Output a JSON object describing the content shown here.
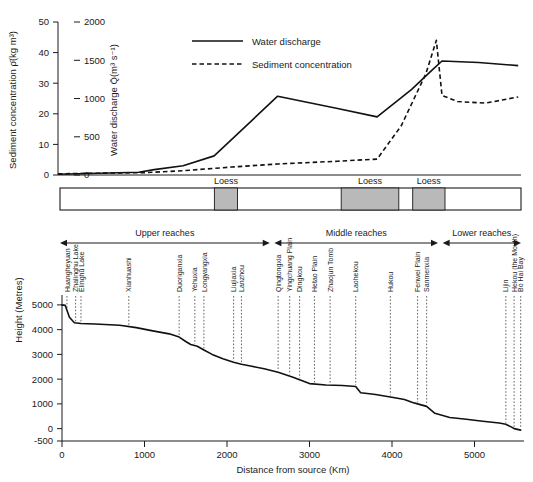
{
  "figure": {
    "title_hidden": "Yellow River longitudinal profile with water discharge and sediment concentration"
  },
  "top_chart": {
    "left_axis_title": "Sediment concentration  ρ̄(kg m³)",
    "right_axis_title": "Water discharge  Q̄(m³ s⁻¹)",
    "left_ticks": [
      "0",
      "10",
      "20",
      "30",
      "40",
      "50"
    ],
    "right_ticks": [
      "0",
      "500",
      "1000",
      "1500",
      "2000"
    ],
    "legend": [
      {
        "label": "Water discharge",
        "style": "solid"
      },
      {
        "label": "Sediment concentration",
        "style": "dashed"
      }
    ]
  },
  "loess_bar": {
    "label": "Loess",
    "bands": [
      {
        "start_pct": 33.5,
        "end_pct": 38.5
      },
      {
        "start_pct": 61.0,
        "end_pct": 73.5
      },
      {
        "start_pct": 76.5,
        "end_pct": 83.5
      }
    ]
  },
  "reaches": [
    {
      "label": "Upper reaches",
      "start_pct": 0.0,
      "end_pct": 45.5
    },
    {
      "label": "Middle reaches",
      "start_pct": 46.5,
      "end_pct": 82.0
    },
    {
      "label": "Lower reaches",
      "start_pct": 83.0,
      "end_pct": 100.0
    }
  ],
  "bottom_chart": {
    "y_axis_title": "Height (Metres)",
    "x_axis_title": "Distance from source (Km)",
    "y_ticks": [
      "-500",
      "0",
      "1000",
      "2000",
      "3000",
      "4000",
      "5000"
    ],
    "x_ticks": [
      "0",
      "1000",
      "2000",
      "3000",
      "4000",
      "5000"
    ],
    "xlim": [
      0,
      5600
    ],
    "ylim": [
      -500,
      5400
    ]
  },
  "sites": [
    {
      "name": "Huangheyuan",
      "km": 60
    },
    {
      "name": "Zhalinghu Lake",
      "km": 165
    },
    {
      "name": "Elinghu Lake",
      "km": 230
    },
    {
      "name": "Xianhuashi",
      "km": 810
    },
    {
      "name": "Duoriganxia",
      "km": 1420
    },
    {
      "name": "Yehuxia",
      "km": 1610
    },
    {
      "name": "Longyangxia",
      "km": 1720
    },
    {
      "name": "Liujiaxia",
      "km": 2080
    },
    {
      "name": "Lanzhou",
      "km": 2175
    },
    {
      "name": "Qingtongxia",
      "km": 2620
    },
    {
      "name": "Yingchuang Plain",
      "km": 2760
    },
    {
      "name": "Dingkou",
      "km": 2880
    },
    {
      "name": "Hetao Plain",
      "km": 3060
    },
    {
      "name": "Zhaojun Tomb",
      "km": 3250
    },
    {
      "name": "Laohekou",
      "km": 3560
    },
    {
      "name": "Hukou",
      "km": 3980
    },
    {
      "name": "Fenwei Plain",
      "km": 4310
    },
    {
      "name": "Sanmenxia",
      "km": 4420
    },
    {
      "name": "Lijin",
      "km": 5380
    },
    {
      "name": "Hekou (the Mouth)",
      "km": 5480
    },
    {
      "name": "Bo Hai Bay",
      "km": 5560
    }
  ],
  "chart_data": [
    {
      "type": "line",
      "id": "water-discharge",
      "title": "Water discharge along the Yellow River",
      "xlabel": "Distance from source (Km)",
      "ylabel": "Water discharge  Q̄(m³ s⁻¹)",
      "ylim": [
        0,
        2000
      ],
      "xlim": [
        0,
        5600
      ],
      "grid": false,
      "legend_position": "top-center",
      "x": [
        0,
        180,
        400,
        810,
        1250,
        2150,
        3000,
        3560,
        4050,
        4350,
        4480,
        5000,
        5560
      ],
      "values": [
        10,
        35,
        70,
        120,
        250,
        1030,
        870,
        760,
        1120,
        1380,
        1490,
        1470,
        1430
      ]
    },
    {
      "type": "line",
      "id": "sediment-concentration",
      "title": "Sediment concentration along the Yellow River",
      "xlabel": "Distance from source (Km)",
      "ylabel": "Sediment concentration  ρ̄(kg m³)",
      "ylim": [
        0,
        50
      ],
      "xlim": [
        0,
        5600
      ],
      "grid": false,
      "legend_position": "top-center",
      "x": [
        0,
        300,
        810,
        1500,
        2150,
        3000,
        3400,
        3560,
        3900,
        4250,
        4400,
        4480,
        4700,
        5100,
        5560
      ],
      "values": [
        0.4,
        0.8,
        1.4,
        2.6,
        3.6,
        4.5,
        5.0,
        5.2,
        16.0,
        33.0,
        44.0,
        26.0,
        24.0,
        23.5,
        25.5
      ]
    },
    {
      "type": "line",
      "id": "elevation-profile",
      "title": "Longitudinal elevation profile of the Yellow River",
      "xlabel": "Distance from source (Km)",
      "ylabel": "Height (Metres)",
      "ylim": [
        -500,
        5400
      ],
      "xlim": [
        0,
        5600
      ],
      "grid": false,
      "x": [
        0,
        40,
        90,
        150,
        230,
        400,
        700,
        900,
        1100,
        1300,
        1420,
        1500,
        1560,
        1640,
        1720,
        1820,
        1950,
        2080,
        2175,
        2300,
        2450,
        2620,
        2800,
        3000,
        3200,
        3400,
        3560,
        3620,
        3700,
        3800,
        3980,
        4050,
        4150,
        4250,
        4310,
        4420,
        4520,
        4700,
        4900,
        5100,
        5300,
        5380,
        5450,
        5480,
        5560
      ],
      "values": [
        5000,
        4980,
        4500,
        4280,
        4250,
        4230,
        4180,
        4080,
        3950,
        3830,
        3700,
        3520,
        3400,
        3330,
        3180,
        3000,
        2820,
        2680,
        2600,
        2520,
        2420,
        2280,
        2080,
        1820,
        1760,
        1740,
        1700,
        1450,
        1420,
        1380,
        1280,
        1240,
        1180,
        1060,
        1000,
        900,
        620,
        450,
        380,
        300,
        230,
        180,
        60,
        0,
        -60
      ]
    }
  ]
}
